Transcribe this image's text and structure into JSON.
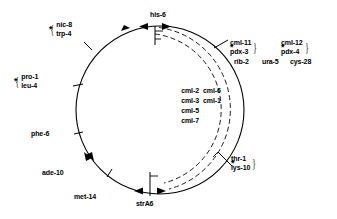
{
  "diagram": {
    "type": "circular-genetic-map",
    "stroke_color": "#000000",
    "background_color": "#ffffff"
  },
  "markers": {
    "top": {
      "label": "his-6"
    },
    "bottom": {
      "label": "strA6"
    },
    "top_left_pair": {
      "line1": "nic-8",
      "line2": "trp-4",
      "asterisk": "*"
    },
    "left_pair": {
      "line1": "pro-1",
      "line2": "leu-4",
      "asterisk": "*"
    },
    "left_single": {
      "label": "phe-6"
    },
    "lower_left": {
      "label": "ade-10"
    },
    "bottom_left": {
      "label": "met-14"
    },
    "lower_right_pair": {
      "line1": "thr-1",
      "line2": "lys-10",
      "asterisk": "*"
    },
    "right_group_a": {
      "line1": "cml-11",
      "line2": "pdx-3",
      "line3": "rib-2",
      "asterisk": "*"
    },
    "right_group_b": {
      "line1": "cml-12",
      "line2": "pdx-4",
      "asterisk": "*"
    },
    "right_extra": {
      "line1": "ura-5",
      "line2": "cys-28"
    },
    "interior_left_column": [
      "cml-2",
      "cml-3",
      "cml-5",
      "cml-7"
    ],
    "interior_right_column": [
      "cml-6",
      "cml-1"
    ]
  }
}
